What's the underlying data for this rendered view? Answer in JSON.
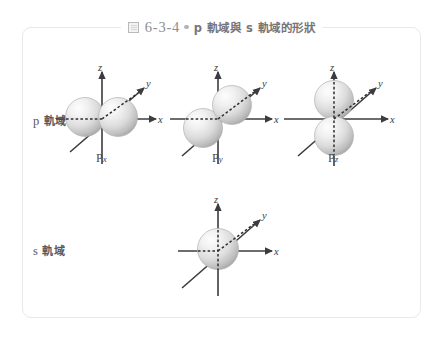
{
  "caption": {
    "icon": "figure-box-icon",
    "number": "6-3-4",
    "bullet": "dot-separator",
    "text": "p 軌域與 s 軌域的形狀"
  },
  "rows": [
    {
      "id": "p",
      "label_latin": "p",
      "label_cjk": "軌域"
    },
    {
      "id": "s",
      "label_latin": "s",
      "label_cjk": "軌域"
    }
  ],
  "diagrams": [
    {
      "id": "px",
      "orbital": "p",
      "sub_main": "P",
      "sub_index": "x",
      "axes": {
        "z": "z",
        "y": "y",
        "x": "x"
      },
      "lobe_axis": "x",
      "lobe_count": 2
    },
    {
      "id": "py",
      "orbital": "p",
      "sub_main": "P",
      "sub_index": "y",
      "axes": {
        "z": "z",
        "y": "y",
        "x": "x"
      },
      "lobe_axis": "y",
      "lobe_count": 2
    },
    {
      "id": "pz",
      "orbital": "p",
      "sub_main": "P",
      "sub_index": "z",
      "axes": {
        "z": "z",
        "y": "y",
        "x": "x"
      },
      "lobe_axis": "z",
      "lobe_count": 2
    },
    {
      "id": "s",
      "orbital": "s",
      "sub_main": "",
      "sub_index": "",
      "axes": {
        "z": "z",
        "y": "y",
        "x": "x"
      },
      "lobe_axis": "none",
      "lobe_count": 1
    }
  ],
  "colors": {
    "frame_border": "#e9e9ea",
    "page_background": "#ffffff",
    "caption_number": "#8e8e91",
    "caption_text": "#76767a",
    "axis": "#3c3c40",
    "label_text": "#5a5a5e",
    "sphere_highlight": "#fbfbfb",
    "sphere_mid": "#e2e2e2",
    "sphere_shadow": "#9e9e9e"
  }
}
